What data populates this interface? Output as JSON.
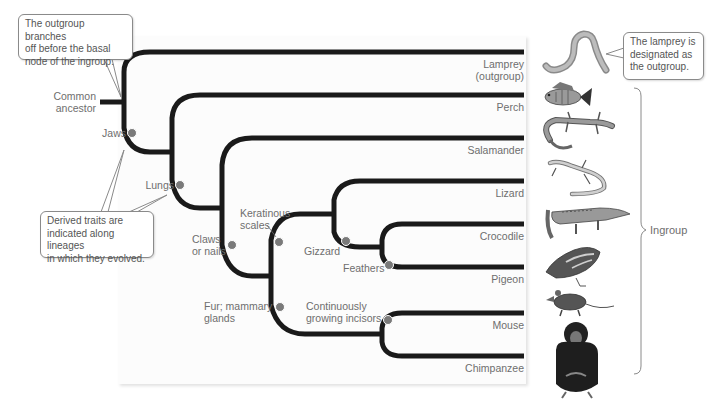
{
  "diagram": {
    "type": "phylogenetic-tree",
    "root_label": "Common\nancestor",
    "root_label_lines": [
      "Common",
      "ancestor"
    ],
    "taxa": [
      {
        "name": "Lamprey",
        "sub": "(outgroup)",
        "y": 52
      },
      {
        "name": "Perch",
        "y": 95
      },
      {
        "name": "Salamander",
        "y": 138
      },
      {
        "name": "Lizard",
        "y": 181
      },
      {
        "name": "Crocodile",
        "y": 224
      },
      {
        "name": "Pigeon",
        "y": 267
      },
      {
        "name": "Mouse",
        "y": 313
      },
      {
        "name": "Chimpanzee",
        "y": 356
      }
    ],
    "traits": [
      {
        "label": "Jaws",
        "lines": [
          "Jaws"
        ]
      },
      {
        "label": "Lungs",
        "lines": [
          "Lungs"
        ]
      },
      {
        "label": "Claws or nails",
        "lines": [
          "Claws",
          "or nails"
        ]
      },
      {
        "label": "Keratinous scales",
        "lines": [
          "Keratinous",
          "scales"
        ]
      },
      {
        "label": "Gizzard",
        "lines": [
          "Gizzard"
        ]
      },
      {
        "label": "Feathers",
        "lines": [
          "Feathers"
        ]
      },
      {
        "label": "Fur; mammary glands",
        "lines": [
          "Fur; mammary",
          "glands"
        ]
      },
      {
        "label": "Continuously growing incisors",
        "lines": [
          "Continuously",
          "growing incisors"
        ]
      }
    ],
    "callouts": {
      "outgroup_branches": {
        "lines": [
          "The outgroup branches",
          "off before the basal",
          "node of the ingroup."
        ]
      },
      "derived_traits": {
        "lines": [
          "Derived traits are",
          "indicated along lineages",
          "in which they evolved."
        ]
      },
      "lamprey_outgroup": {
        "lines": [
          "The lamprey is",
          "designated as",
          "the outgroup."
        ]
      }
    },
    "ingroup_label": "Ingroup",
    "colors": {
      "branch": "#1a1a1a",
      "trait_dot": "#7a7a7a",
      "text": "#6e6e6e",
      "callout_border": "#8a8a8a",
      "panel": "#fcfcfc"
    }
  }
}
